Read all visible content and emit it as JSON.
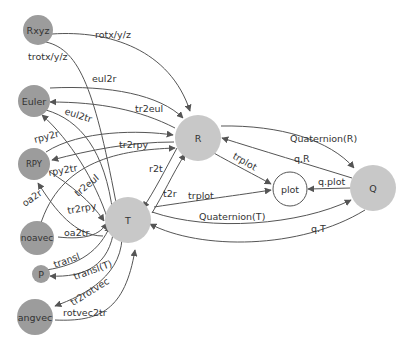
{
  "diagram": {
    "colors": {
      "dark_node": "#9c9c9c",
      "light_node": "#c8c8c8",
      "plot_node": "#ffffff",
      "edge": "#555555"
    },
    "nodes": {
      "Rxyz": {
        "label": "Rxyz"
      },
      "Euler": {
        "label": "Euler"
      },
      "RPY": {
        "label": "RPY"
      },
      "noavec": {
        "label": "noavec"
      },
      "P": {
        "label": "P"
      },
      "angvec": {
        "label": "angvec"
      },
      "R": {
        "label": "R"
      },
      "T": {
        "label": "T"
      },
      "plot": {
        "label": "plot"
      },
      "Q": {
        "label": "Q"
      }
    },
    "edges": {
      "rotxyz": {
        "label": "rotx/y/z",
        "from": "Rxyz",
        "to": "R"
      },
      "trotxyz": {
        "label": "trotx/y/z",
        "from": "Rxyz",
        "to": "T"
      },
      "eul2r": {
        "label": "eul2r",
        "from": "Euler",
        "to": "R"
      },
      "tr2eul_R": {
        "label": "tr2eul",
        "from": "R",
        "to": "Euler"
      },
      "eul2tr": {
        "label": "eul2tr",
        "from": "Euler",
        "to": "T"
      },
      "tr2eul_T": {
        "label": "tr2eul",
        "from": "T",
        "to": "Euler"
      },
      "rpy2r": {
        "label": "rpy2r",
        "from": "RPY",
        "to": "R"
      },
      "tr2rpy_R": {
        "label": "tr2rpy",
        "from": "R",
        "to": "RPY"
      },
      "rpy2tr": {
        "label": "rpy2tr",
        "from": "RPY",
        "to": "T"
      },
      "tr2rpy_T": {
        "label": "tr2rpy",
        "from": "T",
        "to": "RPY"
      },
      "oa2r": {
        "label": "oa2r",
        "from": "noavec",
        "to": "R"
      },
      "oa2tr": {
        "label": "oa2tr",
        "from": "noavec",
        "to": "T"
      },
      "transl": {
        "label": "transl",
        "from": "P",
        "to": "T"
      },
      "transl_T": {
        "label": "transl(T)",
        "from": "T",
        "to": "P"
      },
      "tr2rotvec": {
        "label": "tr2rotvec",
        "from": "T",
        "to": "angvec"
      },
      "rotvec2tr": {
        "label": "rotvec2tr",
        "from": "angvec",
        "to": "T"
      },
      "r2t": {
        "label": "r2t",
        "from": "R",
        "to": "T"
      },
      "t2r": {
        "label": "t2r",
        "from": "T",
        "to": "R"
      },
      "trplot_R": {
        "label": "trplot",
        "from": "R",
        "to": "plot"
      },
      "trplot_T": {
        "label": "trplot",
        "from": "T",
        "to": "plot"
      },
      "QuaternionR": {
        "label": "Quaternion(R)",
        "from": "R",
        "to": "Q"
      },
      "qR": {
        "label": "q.R",
        "from": "Q",
        "to": "R"
      },
      "qplot": {
        "label": "q.plot",
        "from": "Q",
        "to": "plot"
      },
      "QuaternionT": {
        "label": "Quaternion(T)",
        "from": "T",
        "to": "Q"
      },
      "qT": {
        "label": "q.T",
        "from": "Q",
        "to": "T"
      }
    }
  }
}
